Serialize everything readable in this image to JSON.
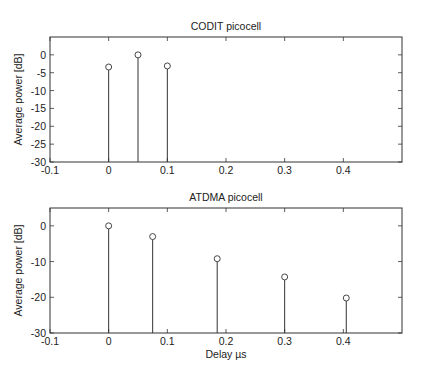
{
  "chart_data": [
    {
      "type": "stem",
      "title": "CODIT picocell",
      "xlabel": "",
      "ylabel": "Average power [dB]",
      "xlim": [
        -0.1,
        0.5
      ],
      "ylim": [
        -30,
        5
      ],
      "xticks": [
        -0.1,
        0,
        0.1,
        0.2,
        0.3,
        0.4
      ],
      "xtick_labels": [
        "-0.1",
        "0",
        "0.1",
        "0.2",
        "0.3",
        "0.4"
      ],
      "yticks": [
        0,
        -5,
        -10,
        -15,
        -20,
        -25,
        -30
      ],
      "ytick_labels": [
        "0",
        "-5",
        "-10",
        "-15",
        "-20",
        "-25",
        "-30"
      ],
      "grid": false,
      "x": [
        0,
        0.05,
        0.1
      ],
      "values": [
        -3.4,
        0,
        -3.1
      ]
    },
    {
      "type": "stem",
      "title": "ATDMA picocell",
      "xlabel": "Delay µs",
      "ylabel": "Average power [dB]",
      "xlim": [
        -0.1,
        0.5
      ],
      "ylim": [
        -30,
        5
      ],
      "xticks": [
        -0.1,
        0,
        0.1,
        0.2,
        0.3,
        0.4
      ],
      "xtick_labels": [
        "-0.1",
        "0",
        "0.1",
        "0.2",
        "0.3",
        "0.4"
      ],
      "yticks": [
        0,
        -10,
        -20,
        -30
      ],
      "ytick_labels": [
        "0",
        "-10",
        "-20",
        "-30"
      ],
      "grid": false,
      "x": [
        0,
        0.075,
        0.185,
        0.3,
        0.405
      ],
      "values": [
        0,
        -3,
        -9.2,
        -14.3,
        -20.2
      ]
    }
  ]
}
